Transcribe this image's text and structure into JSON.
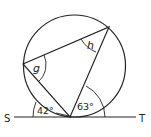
{
  "diagram": {
    "labels": {
      "S": "S",
      "T": "T",
      "angle_g": "g",
      "angle_h": "h",
      "angle_left": "42°",
      "angle_right": "63°"
    },
    "colors": {
      "stroke": "#222222",
      "background": "#ffffff"
    }
  }
}
